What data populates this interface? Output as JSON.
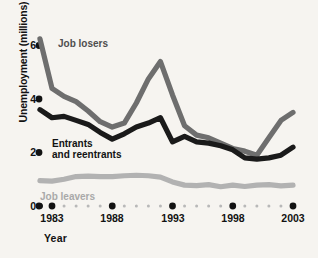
{
  "chart_data": {
    "type": "line",
    "title": "",
    "xlabel": "Year",
    "ylabel": "Unemployment (millions)",
    "xlim": [
      1982,
      2003.4
    ],
    "ylim": [
      0,
      6.6
    ],
    "grid": false,
    "legend_position": "inline-labels",
    "x_tick_labels": [
      "1983",
      "1988",
      "1993",
      "1998",
      "2003"
    ],
    "x_tick_values": [
      1983,
      1988,
      1993,
      1998,
      2003
    ],
    "y_tick_labels": [
      "0",
      "2",
      "4",
      "6"
    ],
    "y_tick_values": [
      0,
      2,
      4,
      6
    ],
    "x": [
      1982,
      1983,
      1984,
      1985,
      1986,
      1987,
      1988,
      1989,
      1990,
      1991,
      1992,
      1993,
      1994,
      1995,
      1996,
      1997,
      1998,
      1999,
      2000,
      2001,
      2002,
      2003
    ],
    "series": [
      {
        "name": "Job losers",
        "color": "#6e6e6e",
        "values": [
          6.25,
          4.4,
          4.1,
          3.9,
          3.55,
          3.15,
          2.95,
          3.1,
          3.85,
          4.75,
          5.4,
          4.15,
          3.0,
          2.65,
          2.55,
          2.35,
          2.15,
          2.05,
          1.9,
          2.55,
          3.2,
          3.5
        ]
      },
      {
        "name": "Entrants and reentrants",
        "color": "#1a1a1a",
        "values": [
          3.6,
          3.3,
          3.35,
          3.2,
          3.05,
          2.75,
          2.5,
          2.7,
          2.95,
          3.1,
          3.3,
          2.4,
          2.6,
          2.4,
          2.35,
          2.25,
          2.1,
          1.8,
          1.75,
          1.8,
          1.9,
          2.2
        ]
      },
      {
        "name": "Job leavers",
        "color": "#b2b2b2",
        "values": [
          0.95,
          0.93,
          1.0,
          1.1,
          1.12,
          1.1,
          1.1,
          1.13,
          1.15,
          1.13,
          1.08,
          0.9,
          0.78,
          0.76,
          0.8,
          0.72,
          0.78,
          0.73,
          0.78,
          0.8,
          0.75,
          0.78
        ]
      }
    ]
  },
  "labels": {
    "job_losers": "Job losers",
    "entrants_line1": "Entrants",
    "entrants_line2": "and reentrants",
    "job_leavers": "Job leavers"
  }
}
